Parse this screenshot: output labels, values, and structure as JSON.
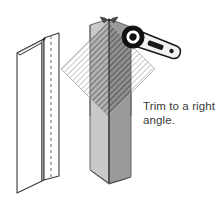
{
  "figure": {
    "caption": "Trim to a right\nangle.",
    "background_color": "#ffffff"
  },
  "palette": {
    "outline": "#3a3a3a",
    "light_face": "#c9c9c9",
    "dark_face": "#9a9a9a",
    "hatch_light": "#b9b9b9",
    "hatch_dark": "#6e6e6e",
    "tool_body": "#f2f2f2",
    "tool_outline": "#1a1a1a",
    "tool_head": "#111111",
    "caption_color": "#3b3b3b",
    "dashed_fold": "#6a6a6a"
  },
  "objects": {
    "unfolded_bead": {
      "label": "corner-bead-outline",
      "description": "Open outline view of folded drywall corner bead, two flanges meeting at a vertical fold",
      "fold_line_style": "dashed",
      "fill": "#ffffff",
      "stroke": "#3a3a3a"
    },
    "shaded_bead": {
      "label": "corner-bead-shaded",
      "description": "Shaded corner bead standing vertically with chevron notched top and bottom",
      "left_face_fill": "#c9c9c9",
      "right_face_fill": "#9a9a9a",
      "top_notch": "chevron",
      "bottom_notch": "chevron"
    },
    "trim_region": {
      "label": "trim-diamond-hatch",
      "description": "Rotated square (diamond) of diagonal hatching marking the area to trim",
      "shape": "diamond",
      "hatch_angle_deg": 45,
      "center_x": 108,
      "center_y": 69,
      "half_diagonal": 47
    },
    "tool": {
      "label": "ratchet-snip-tool",
      "description": "Ratchet style cutting tool with round head and tapered handle",
      "head_fill": "#111111",
      "body_fill": "#f2f2f2",
      "rotation_deg": 22
    }
  }
}
